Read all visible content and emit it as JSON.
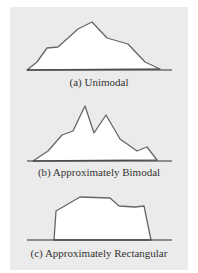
{
  "figure": {
    "background": "#ebebeb",
    "outline_color": "#666666",
    "baseline_color": "#333333",
    "fill_color": "#ffffff"
  },
  "panels": [
    {
      "id": "a",
      "caption": "(a) Unimodal",
      "shape": "unimodal"
    },
    {
      "id": "b",
      "caption": "(b) Approximately Bimodal",
      "shape": "bimodal"
    },
    {
      "id": "c",
      "caption": "(c) Approximately Rectangular",
      "shape": "rectangular"
    }
  ]
}
